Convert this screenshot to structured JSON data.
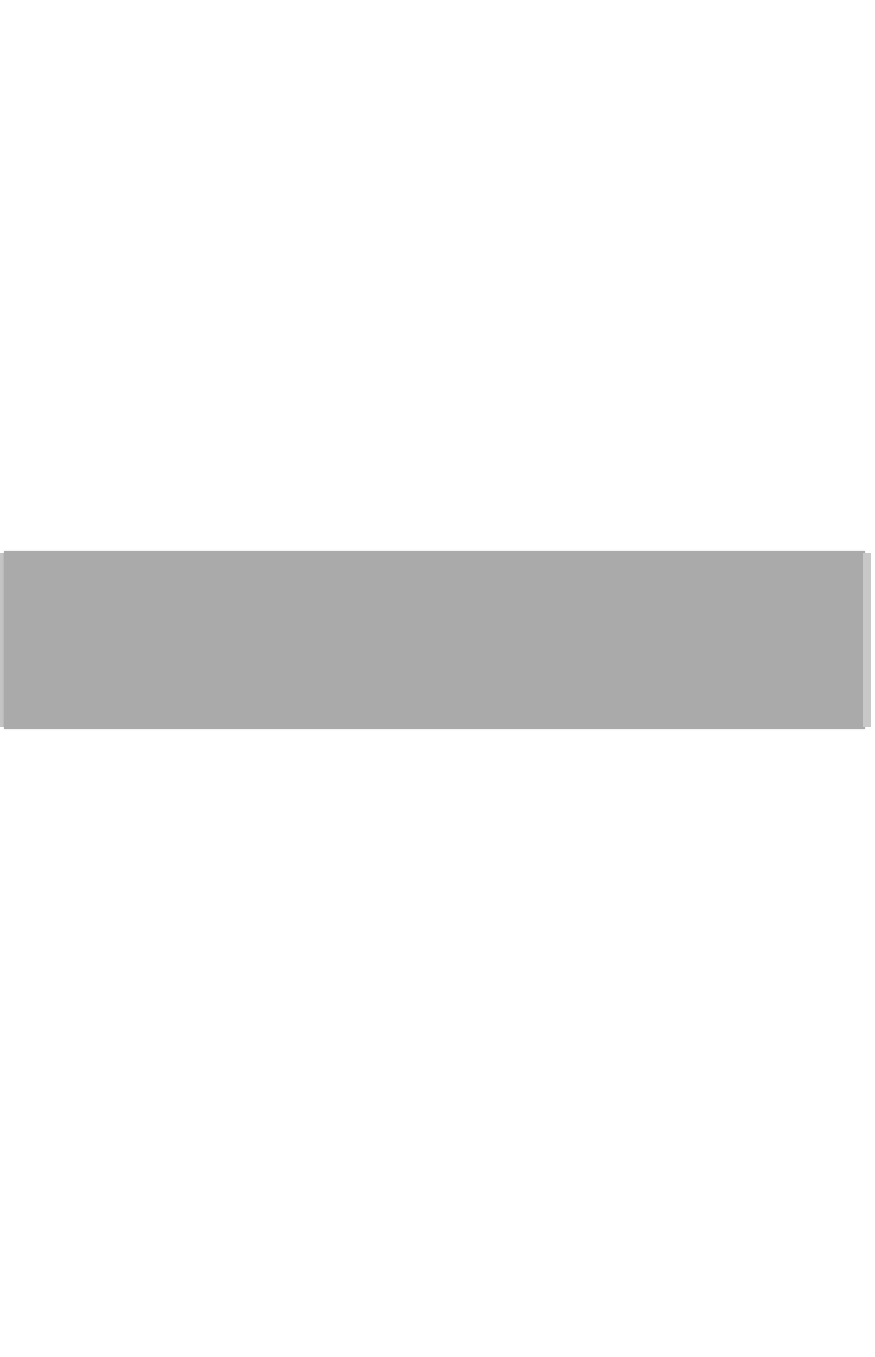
{
  "page": {
    "background_color": "#ffffff",
    "band": {
      "color": "#aaaaaa",
      "description": "gray horizontal band"
    }
  }
}
